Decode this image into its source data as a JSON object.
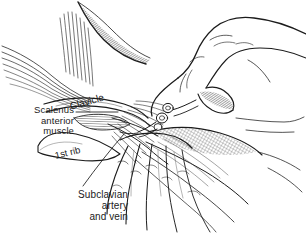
{
  "figure": {
    "style": "black and white medical line drawing with hatching",
    "background_color": "#ffffff",
    "ink_color": "#1b1b1b",
    "width": 306,
    "height": 234
  },
  "labels": {
    "clavicle": "Clavicle",
    "scalenus": "Scalenus\nanterior\nmuscle",
    "first_rib": "1st rib",
    "subclavian": "Subclavian\nartery\nand vein"
  },
  "anatomy": {
    "structures": [
      "clavicle",
      "scalenus anterior muscle",
      "1st rib",
      "subclavian artery",
      "subclavian vein",
      "sternocleidomastoid muscle",
      "pectoralis major muscle"
    ]
  },
  "instruments": {
    "items": [
      "syringe",
      "needle"
    ]
  },
  "hands": {
    "items": [
      "operator hand holding syringe",
      "operator hand palpating landmark"
    ]
  }
}
